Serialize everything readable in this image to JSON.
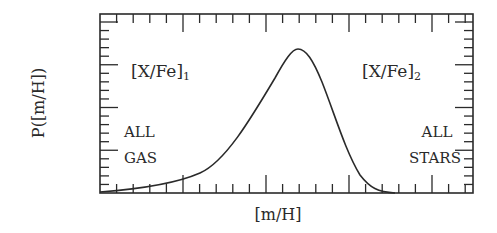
{
  "chart_data": {
    "type": "line",
    "title": "",
    "xlabel": "[m/H]",
    "ylabel": "P([m/H])",
    "x_tick_labels": [],
    "y_tick_labels": [],
    "grid": false,
    "frame": {
      "left": 100,
      "right": 473,
      "top": 14,
      "bottom": 193
    },
    "x_ticks": {
      "major_every": 5,
      "count": 22
    },
    "y_ticks": {
      "major_every": 5,
      "count": 21
    },
    "series": [
      {
        "name": "P([m/H])",
        "description": "Skewed single-peaked metallicity distribution; long low tail to the left, steep drop to zero on the right",
        "x": [
          0.0,
          0.1,
          0.2,
          0.3,
          0.35,
          0.4,
          0.45,
          0.5,
          0.55,
          0.6,
          0.65,
          0.7,
          0.75,
          0.8,
          0.85,
          1.0
        ],
        "y": [
          0.0,
          0.03,
          0.07,
          0.14,
          0.21,
          0.32,
          0.48,
          0.68,
          0.88,
          1.0,
          0.93,
          0.72,
          0.45,
          0.2,
          0.05,
          0.0
        ],
        "peak": {
          "x": 0.59,
          "y": 1.0
        }
      }
    ],
    "annotations": [
      {
        "text": "[X/Fe]",
        "subscript": "1",
        "position": "upper-left"
      },
      {
        "text": "[X/Fe]",
        "subscript": "2",
        "position": "upper-right"
      },
      {
        "text": "ALL",
        "position": "lower-left-line1"
      },
      {
        "text": "GAS",
        "position": "lower-left-line2"
      },
      {
        "text": "ALL",
        "position": "lower-right-line1"
      },
      {
        "text": "STARS",
        "position": "lower-right-line2"
      }
    ]
  },
  "labels": {
    "xlabel": "[m/H]",
    "ylabel": "P([m/H])",
    "xfe1_main": "[X/Fe]",
    "xfe1_sub": "1",
    "xfe2_main": "[X/Fe]",
    "xfe2_sub": "2",
    "all_gas_1": "ALL",
    "all_gas_2": "GAS",
    "all_stars_1": "ALL",
    "all_stars_2": "STARS"
  },
  "colors": {
    "ink": "#2a2a2a",
    "background": "#ffffff"
  }
}
